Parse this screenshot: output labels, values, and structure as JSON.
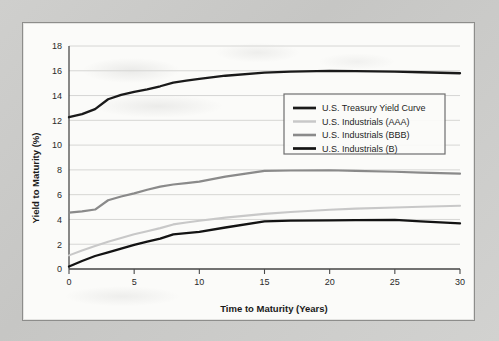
{
  "figure": {
    "panel_background": "#fbfbf9",
    "page_background": "#c9c9c7",
    "border_color": "#8d8d8b"
  },
  "chart_data": {
    "type": "line",
    "title": "",
    "xlabel": "Time to Maturity (Years)",
    "ylabel": "Yield to Maturity (%)",
    "xlim": [
      0,
      30
    ],
    "ylim": [
      0,
      18
    ],
    "xticks": [
      0,
      5,
      10,
      15,
      20,
      25,
      30
    ],
    "yticks": [
      0,
      2,
      4,
      6,
      8,
      10,
      12,
      14,
      16,
      18
    ],
    "grid": "horizontal",
    "legend_position": "center-right",
    "x": [
      0,
      1,
      2,
      3,
      4,
      5,
      6,
      7,
      8,
      9,
      10,
      12,
      15,
      17,
      20,
      22,
      25,
      27,
      30
    ],
    "series": [
      {
        "name": "U.S. Treasury Yield Curve",
        "color": "#1a1a1a",
        "width": 2.3,
        "values": [
          12.25,
          12.5,
          12.9,
          13.7,
          14.05,
          14.3,
          14.5,
          14.75,
          15.05,
          15.2,
          15.35,
          15.6,
          15.85,
          15.93,
          16.0,
          15.98,
          15.93,
          15.88,
          15.8
        ]
      },
      {
        "name": "U.S. Industrials (AAA)",
        "color": "#c8c8c8",
        "width": 2.1,
        "values": [
          1.1,
          1.5,
          1.85,
          2.2,
          2.5,
          2.8,
          3.05,
          3.3,
          3.6,
          3.75,
          3.9,
          4.15,
          4.45,
          4.6,
          4.78,
          4.87,
          4.97,
          5.02,
          5.1
        ]
      },
      {
        "name": "U.S. Industrials (BBB)",
        "color": "#8a8a8a",
        "width": 2.2,
        "values": [
          4.55,
          4.65,
          4.8,
          5.55,
          5.85,
          6.1,
          6.4,
          6.65,
          6.82,
          6.93,
          7.05,
          7.45,
          7.92,
          7.95,
          7.97,
          7.92,
          7.85,
          7.78,
          7.7
        ]
      },
      {
        "name": "U.S. Industrials (B)",
        "color": "#131313",
        "width": 2.3,
        "values": [
          0.2,
          0.65,
          1.05,
          1.35,
          1.65,
          1.95,
          2.2,
          2.45,
          2.8,
          2.9,
          3.0,
          3.35,
          3.85,
          3.9,
          3.93,
          3.95,
          3.97,
          3.85,
          3.68
        ]
      }
    ]
  }
}
